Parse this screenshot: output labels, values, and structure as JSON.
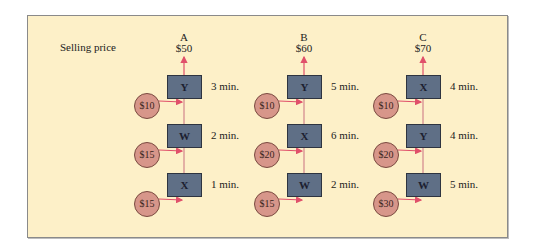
{
  "label": "Selling price",
  "colors": {
    "panel": "#fdf0c8",
    "box": "#5f6f86",
    "coin": "#d7968a",
    "arrow": "#e0506a"
  },
  "columns": [
    {
      "name": "A",
      "price": "$50",
      "cx": 184,
      "steps": [
        {
          "machine": "Y",
          "time": "3 min."
        },
        {
          "machine": "W",
          "time": "2 min."
        },
        {
          "machine": "X",
          "time": "1 min."
        }
      ],
      "inputs": [
        "$10",
        "$15",
        "$15"
      ]
    },
    {
      "name": "B",
      "price": "$60",
      "cx": 304,
      "steps": [
        {
          "machine": "Y",
          "time": "5 min."
        },
        {
          "machine": "X",
          "time": "6 min."
        },
        {
          "machine": "W",
          "time": "2 min."
        }
      ],
      "inputs": [
        "$10",
        "$20",
        "$15"
      ]
    },
    {
      "name": "C",
      "price": "$70",
      "cx": 423,
      "steps": [
        {
          "machine": "X",
          "time": "4 min."
        },
        {
          "machine": "Y",
          "time": "4 min."
        },
        {
          "machine": "W",
          "time": "5 min."
        }
      ],
      "inputs": [
        "$10",
        "$20",
        "$30"
      ]
    }
  ]
}
